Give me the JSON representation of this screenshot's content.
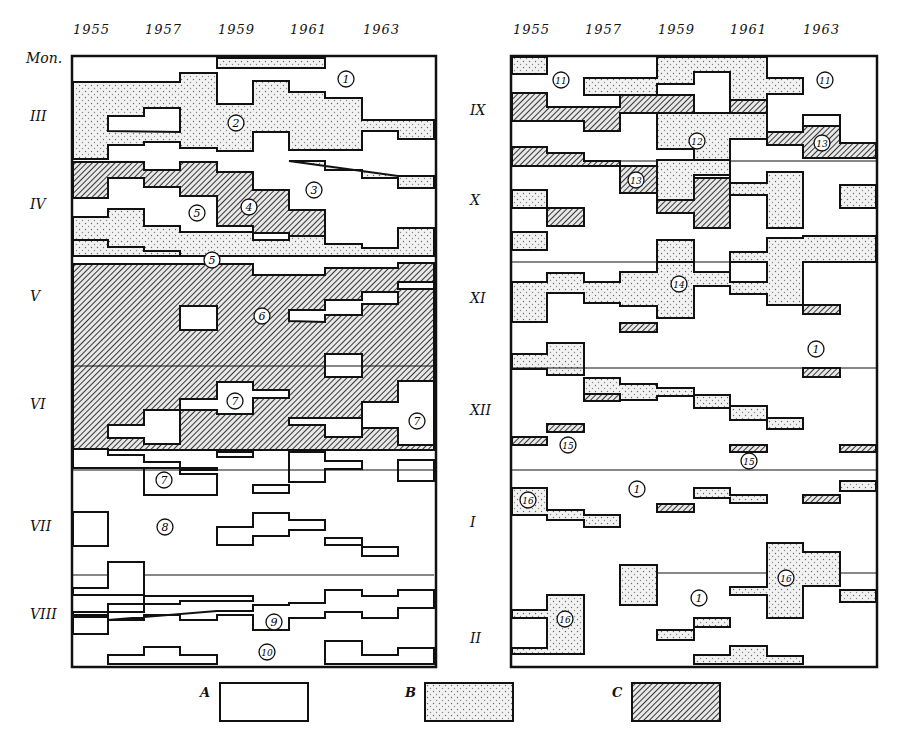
{
  "figure": {
    "left_panel": {
      "years": [
        "1955",
        "1957",
        "1959",
        "1961",
        "1963"
      ],
      "corner_label": "Mon.",
      "months": [
        {
          "label": "III",
          "y": 118
        },
        {
          "label": "IV",
          "y": 206
        },
        {
          "label": "V",
          "y": 298
        },
        {
          "label": "VI",
          "y": 406
        },
        {
          "label": "VII",
          "y": 528
        },
        {
          "label": "VIII",
          "y": 616
        }
      ]
    },
    "right_panel": {
      "years": [
        "1955",
        "1957",
        "1959",
        "1961",
        "1963"
      ],
      "months": [
        {
          "label": "IX",
          "y": 112
        },
        {
          "label": "X",
          "y": 202
        },
        {
          "label": "XI",
          "y": 300
        },
        {
          "label": "XII",
          "y": 412
        },
        {
          "label": "I",
          "y": 524
        },
        {
          "label": "II",
          "y": 640
        }
      ]
    },
    "legend": [
      {
        "key": "A",
        "fill": "white"
      },
      {
        "key": "B",
        "fill": "dotted"
      },
      {
        "key": "C",
        "fill": "hatched"
      }
    ],
    "region_numbers": [
      {
        "n": "1",
        "x": 346,
        "y": 79
      },
      {
        "n": "2",
        "x": 236,
        "y": 123
      },
      {
        "n": "3",
        "x": 314,
        "y": 190
      },
      {
        "n": "4",
        "x": 249,
        "y": 207
      },
      {
        "n": "5",
        "x": 197,
        "y": 213
      },
      {
        "n": "5",
        "x": 212,
        "y": 260
      },
      {
        "n": "6",
        "x": 262,
        "y": 316
      },
      {
        "n": "7",
        "x": 235,
        "y": 401
      },
      {
        "n": "7",
        "x": 417,
        "y": 421
      },
      {
        "n": "7",
        "x": 164,
        "y": 480
      },
      {
        "n": "8",
        "x": 165,
        "y": 527
      },
      {
        "n": "9",
        "x": 274,
        "y": 622
      },
      {
        "n": "10",
        "x": 267,
        "y": 652
      },
      {
        "n": "11",
        "x": 561,
        "y": 80
      },
      {
        "n": "11",
        "x": 825,
        "y": 80
      },
      {
        "n": "12",
        "x": 697,
        "y": 141
      },
      {
        "n": "13",
        "x": 822,
        "y": 143
      },
      {
        "n": "13",
        "x": 636,
        "y": 180
      },
      {
        "n": "14",
        "x": 679,
        "y": 284
      },
      {
        "n": "1",
        "x": 816,
        "y": 349
      },
      {
        "n": "15",
        "x": 568,
        "y": 445
      },
      {
        "n": "15",
        "x": 749,
        "y": 461
      },
      {
        "n": "1",
        "x": 637,
        "y": 489
      },
      {
        "n": "16",
        "x": 528,
        "y": 500
      },
      {
        "n": "16",
        "x": 786,
        "y": 578
      },
      {
        "n": "1",
        "x": 699,
        "y": 598
      },
      {
        "n": "16",
        "x": 565,
        "y": 619
      }
    ],
    "caption_partial": ""
  }
}
